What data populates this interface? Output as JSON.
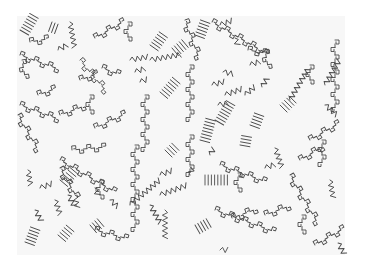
{
  "image": {
    "description": "Hand-drawn pen-and-ink pattern on white paper: radiating groups of parallel hatch lines, zigzag squiggles, and chains of small square/spiral glyphs linked by lines",
    "paper": {
      "x": 17,
      "y": 16,
      "width": 328,
      "height": 239,
      "color": "#f7f7f7"
    },
    "ink_color": "#4a4a4a",
    "background": "#ffffff",
    "motifs": {
      "hatch_fans": [
        {
          "x": 20,
          "y": 30,
          "angle": -60,
          "count": 7
        },
        {
          "x": 52,
          "y": 22,
          "angle": 20,
          "count": 3
        },
        {
          "x": 150,
          "y": 45,
          "angle": -55,
          "count": 6
        },
        {
          "x": 172,
          "y": 48,
          "angle": -40,
          "count": 5
        },
        {
          "x": 160,
          "y": 92,
          "angle": -50,
          "count": 7
        },
        {
          "x": 195,
          "y": 35,
          "angle": -70,
          "count": 6
        },
        {
          "x": 200,
          "y": 140,
          "angle": -75,
          "count": 8
        },
        {
          "x": 215,
          "y": 120,
          "angle": -60,
          "count": 8
        },
        {
          "x": 250,
          "y": 125,
          "angle": -70,
          "count": 5
        },
        {
          "x": 280,
          "y": 105,
          "angle": -45,
          "count": 5
        },
        {
          "x": 60,
          "y": 180,
          "angle": -50,
          "count": 6
        },
        {
          "x": 25,
          "y": 242,
          "angle": -70,
          "count": 6
        },
        {
          "x": 58,
          "y": 235,
          "angle": -50,
          "count": 5
        },
        {
          "x": 90,
          "y": 225,
          "angle": -40,
          "count": 4
        },
        {
          "x": 165,
          "y": 150,
          "angle": -45,
          "count": 4
        },
        {
          "x": 205,
          "y": 175,
          "angle": 0,
          "count": 8
        },
        {
          "x": 195,
          "y": 225,
          "angle": -30,
          "count": 5
        },
        {
          "x": 240,
          "y": 145,
          "angle": -80,
          "count": 4
        }
      ],
      "zigzags": [
        {
          "x": 70,
          "y": 22,
          "angle": 80,
          "len": 28
        },
        {
          "x": 58,
          "y": 50,
          "angle": -30,
          "len": 12
        },
        {
          "x": 130,
          "y": 60,
          "angle": -10,
          "len": 20
        },
        {
          "x": 150,
          "y": 60,
          "angle": -10,
          "len": 32
        },
        {
          "x": 135,
          "y": 72,
          "angle": -20,
          "len": 12
        },
        {
          "x": 140,
          "y": 82,
          "angle": -20,
          "len": 10
        },
        {
          "x": 220,
          "y": 25,
          "angle": -20,
          "len": 14
        },
        {
          "x": 235,
          "y": 38,
          "angle": 70,
          "len": 10
        },
        {
          "x": 223,
          "y": 72,
          "angle": 10,
          "len": 12
        },
        {
          "x": 250,
          "y": 65,
          "angle": -20,
          "len": 12
        },
        {
          "x": 212,
          "y": 85,
          "angle": -15,
          "len": 14
        },
        {
          "x": 225,
          "y": 95,
          "angle": -20,
          "len": 20
        },
        {
          "x": 245,
          "y": 95,
          "angle": -40,
          "len": 14
        },
        {
          "x": 218,
          "y": 105,
          "angle": -10,
          "len": 12
        },
        {
          "x": 262,
          "y": 87,
          "angle": -60,
          "len": 12
        },
        {
          "x": 290,
          "y": 100,
          "angle": -60,
          "len": 38
        },
        {
          "x": 325,
          "y": 85,
          "angle": -60,
          "len": 30
        },
        {
          "x": 325,
          "y": 105,
          "angle": 40,
          "len": 18
        },
        {
          "x": 275,
          "y": 148,
          "angle": 70,
          "len": 22
        },
        {
          "x": 210,
          "y": 155,
          "angle": -60,
          "len": 10
        },
        {
          "x": 190,
          "y": 175,
          "angle": -70,
          "len": 10
        },
        {
          "x": 28,
          "y": 170,
          "angle": 80,
          "len": 18
        },
        {
          "x": 40,
          "y": 188,
          "angle": -20,
          "len": 14
        },
        {
          "x": 35,
          "y": 210,
          "angle": 60,
          "len": 14
        },
        {
          "x": 55,
          "y": 200,
          "angle": 70,
          "len": 18
        },
        {
          "x": 75,
          "y": 195,
          "angle": 80,
          "len": 14
        },
        {
          "x": 68,
          "y": 195,
          "angle": 60,
          "len": 14
        },
        {
          "x": 95,
          "y": 188,
          "angle": 70,
          "len": 10
        },
        {
          "x": 110,
          "y": 200,
          "angle": 40,
          "len": 12
        },
        {
          "x": 130,
          "y": 205,
          "angle": -40,
          "len": 40
        },
        {
          "x": 150,
          "y": 205,
          "angle": 60,
          "len": 22
        },
        {
          "x": 160,
          "y": 175,
          "angle": -20,
          "len": 14
        },
        {
          "x": 160,
          "y": 195,
          "angle": -20,
          "len": 30
        },
        {
          "x": 165,
          "y": 210,
          "angle": 90,
          "len": 30
        },
        {
          "x": 220,
          "y": 250,
          "angle": 0,
          "len": 10
        },
        {
          "x": 265,
          "y": 168,
          "angle": -20,
          "len": 12
        },
        {
          "x": 330,
          "y": 180,
          "angle": 80,
          "len": 20
        },
        {
          "x": 338,
          "y": 243,
          "angle": 60,
          "len": 14
        }
      ],
      "chains": [
        {
          "x": 20,
          "y": 55,
          "angle": 20,
          "links": 6
        },
        {
          "x": 22,
          "y": 60,
          "angle": 80,
          "links": 3
        },
        {
          "x": 30,
          "y": 42,
          "angle": -10,
          "links": 3
        },
        {
          "x": 95,
          "y": 38,
          "angle": -30,
          "links": 5
        },
        {
          "x": 128,
          "y": 22,
          "angle": 90,
          "links": 3
        },
        {
          "x": 80,
          "y": 60,
          "angle": 50,
          "links": 6
        },
        {
          "x": 102,
          "y": 68,
          "angle": 20,
          "links": 3
        },
        {
          "x": 80,
          "y": 80,
          "angle": -20,
          "links": 3
        },
        {
          "x": 38,
          "y": 95,
          "angle": -20,
          "links": 3
        },
        {
          "x": 20,
          "y": 105,
          "angle": 20,
          "links": 6
        },
        {
          "x": 18,
          "y": 115,
          "angle": 60,
          "links": 6
        },
        {
          "x": 60,
          "y": 115,
          "angle": -20,
          "links": 4
        },
        {
          "x": 95,
          "y": 128,
          "angle": -25,
          "links": 5
        },
        {
          "x": 90,
          "y": 95,
          "angle": 90,
          "links": 3
        },
        {
          "x": 145,
          "y": 95,
          "angle": 90,
          "links": 8
        },
        {
          "x": 185,
          "y": 20,
          "angle": 70,
          "links": 6
        },
        {
          "x": 212,
          "y": 22,
          "angle": 30,
          "links": 9
        },
        {
          "x": 248,
          "y": 50,
          "angle": 10,
          "links": 3
        },
        {
          "x": 265,
          "y": 50,
          "angle": 80,
          "links": 3
        },
        {
          "x": 310,
          "y": 65,
          "angle": 90,
          "links": 3
        },
        {
          "x": 335,
          "y": 40,
          "angle": 90,
          "links": 10
        },
        {
          "x": 190,
          "y": 65,
          "angle": 90,
          "links": 8
        },
        {
          "x": 190,
          "y": 135,
          "angle": 90,
          "links": 6
        },
        {
          "x": 60,
          "y": 160,
          "angle": 30,
          "links": 9
        },
        {
          "x": 72,
          "y": 150,
          "angle": -5,
          "links": 5
        },
        {
          "x": 60,
          "y": 168,
          "angle": 60,
          "links": 5
        },
        {
          "x": 100,
          "y": 180,
          "angle": 90,
          "links": 3
        },
        {
          "x": 135,
          "y": 145,
          "angle": 90,
          "links": 12
        },
        {
          "x": 95,
          "y": 230,
          "angle": 15,
          "links": 5
        },
        {
          "x": 220,
          "y": 165,
          "angle": 20,
          "links": 7
        },
        {
          "x": 238,
          "y": 173,
          "angle": 90,
          "links": 3
        },
        {
          "x": 215,
          "y": 210,
          "angle": 20,
          "links": 9
        },
        {
          "x": 232,
          "y": 218,
          "angle": -20,
          "links": 4
        },
        {
          "x": 290,
          "y": 175,
          "angle": 60,
          "links": 8
        },
        {
          "x": 300,
          "y": 160,
          "angle": -30,
          "links": 4
        },
        {
          "x": 310,
          "y": 140,
          "angle": -30,
          "links": 5
        },
        {
          "x": 322,
          "y": 140,
          "angle": 90,
          "links": 4
        },
        {
          "x": 302,
          "y": 215,
          "angle": 90,
          "links": 3
        },
        {
          "x": 315,
          "y": 245,
          "angle": -30,
          "links": 5
        },
        {
          "x": 265,
          "y": 215,
          "angle": -20,
          "links": 4
        }
      ]
    }
  }
}
